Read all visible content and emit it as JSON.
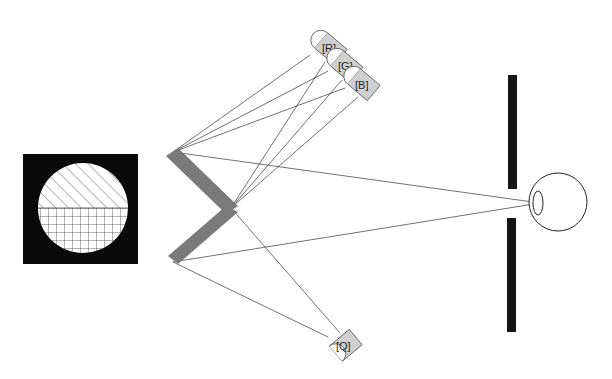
{
  "diagram": {
    "type": "optical-setup",
    "detectors": [
      {
        "id": "R",
        "label": "[R]"
      },
      {
        "id": "G",
        "label": "[G]"
      },
      {
        "id": "B",
        "label": "[B]"
      },
      {
        "id": "Q",
        "label": "[Q]"
      }
    ],
    "components": {
      "target": "split-field-disc",
      "mirror": "v-shaped-mirror",
      "screen": "aperture-screen",
      "observer": "eye"
    },
    "colors": {
      "background": "#ffffff",
      "target_bg": "#0a0a0a",
      "mirror": "#7a7a7a",
      "detector_fill": "#cfcfcf",
      "screen": "#151515",
      "ray": "#333333"
    }
  }
}
